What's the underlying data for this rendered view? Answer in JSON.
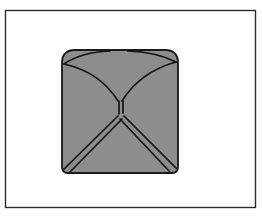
{
  "figure": {
    "canvas": {
      "width": 262,
      "height": 216,
      "background": "#ffffff"
    },
    "frame": {
      "name": "outer-border",
      "x": 5.5,
      "y": 10.5,
      "width": 250,
      "height": 197,
      "stroke": "#2b2b2b",
      "stroke_width": 1.4,
      "fill": "none"
    },
    "shape": {
      "name": "pyramid-body",
      "fill": "#8d8d8d",
      "stroke": "#1a1a1a",
      "stroke_width": 1.8,
      "bounds": {
        "left": 62,
        "top": 50,
        "right": 178,
        "bottom": 173
      },
      "corner_radius_top": 13,
      "corner_radius_bottom": 5,
      "outline_path": "M 75 50 L 165 50 Q 178 50 178 63 L 178 167 Q 178 173 172 173 L 68 173 Q 62 173 62 167 L 62 63 Q 62 50 75 50 Z"
    },
    "fold_lines": {
      "stroke": "#141414",
      "stroke_width": 1.7,
      "edges": [
        {
          "name": "top-left-ridge",
          "type": "curve",
          "path": "M 64 64 Q 100 72 118 101"
        },
        {
          "name": "top-right-ridge",
          "type": "curve",
          "path": "M 176 62 Q 140 72 122 101"
        },
        {
          "name": "top-center-stem",
          "type": "line",
          "path": "M 119 101 L 119 114"
        },
        {
          "name": "top-center-stem-right",
          "type": "line",
          "path": "M 123 101 L 123 113"
        },
        {
          "name": "top-arc-left",
          "type": "curve",
          "path": "M 64 64 Q 82 52 110 51"
        },
        {
          "name": "top-arc-right",
          "type": "curve",
          "path": "M 176 62 Q 156 52 128 51"
        },
        {
          "name": "bottom-left-ridge-outer",
          "type": "line",
          "path": "M 118 116 L 63 170"
        },
        {
          "name": "bottom-left-ridge-inner",
          "type": "line",
          "path": "M 122 119 L 70 172"
        },
        {
          "name": "bottom-right-ridge-outer",
          "type": "line",
          "path": "M 124 116 L 177 169"
        },
        {
          "name": "bottom-right-ridge-inner",
          "type": "line",
          "path": "M 120 119 L 170 172"
        }
      ],
      "apex": {
        "x": 121,
        "y": 115,
        "label": "center-vertex"
      }
    }
  }
}
